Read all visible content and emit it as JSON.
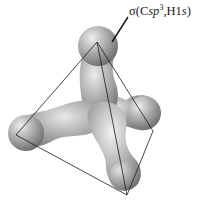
{
  "diagram": {
    "label": {
      "sigma": "σ",
      "open": "(C",
      "hybrid": "sp",
      "exponent": "3",
      "mid": ",H1",
      "orbital": "s",
      "close": ")"
    },
    "colors": {
      "lobe_light": "#e6e6e6",
      "lobe_mid": "#a8a8a8",
      "lobe_dark": "#6e6e6e",
      "edge": "#1a1a1a",
      "background": "#ffffff"
    },
    "tetrahedron_vertices": [
      {
        "name": "top",
        "x": 97,
        "y": 42
      },
      {
        "name": "left",
        "x": 16,
        "y": 135
      },
      {
        "name": "right",
        "x": 153,
        "y": 131
      },
      {
        "name": "bottom",
        "x": 127,
        "y": 195
      }
    ]
  }
}
